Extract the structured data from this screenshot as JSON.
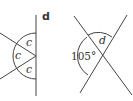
{
  "diagrams": {
    "left": {
      "part_label": "d",
      "angle_labels": [
        "c",
        "c",
        "c"
      ]
    },
    "right": {
      "known_angle": "105°",
      "unknown_angle": "d"
    }
  },
  "colors": {
    "line": "#444444",
    "background": "#ffffff"
  }
}
